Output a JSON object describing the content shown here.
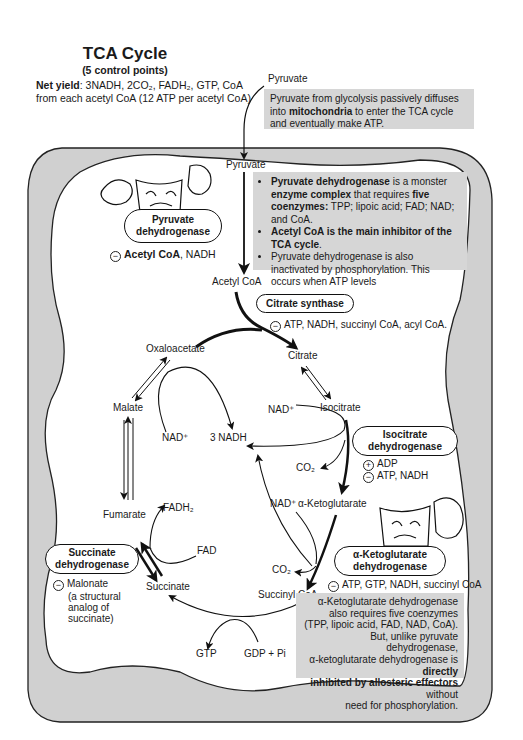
{
  "header": {
    "title": "TCA Cycle",
    "subtitle": "(5 control points)",
    "net_yield_label": "Net yield",
    "net_yield_line1": ":  3NADH, 2CO₂, FADH₂, GTP, CoA",
    "net_yield_line2": "from each acetyl CoA  (12 ATP per acetyl CoA)"
  },
  "entry": {
    "pyruvate_outside": "Pyruvate",
    "note": {
      "text_before": "Pyruvate from glycolysis passively diffuses into ",
      "bold": "mitochondria",
      "text_after": " to enter the TCA cycle and eventually make ATP."
    }
  },
  "pdh": {
    "pyruvate_inside": "Pyruvate",
    "enzyme_line1": "Pyruvate",
    "enzyme_line2": "dehydrogenase",
    "inhibitor_bold": "Acetyl CoA",
    "inhibitor_rest": ", NADH",
    "product": "Acetyl CoA",
    "note": {
      "bullet1_bold1": "Pyruvate dehydrogenase",
      "bullet1_text1": " is a monster ",
      "bullet1_bold2": "enzyme complex",
      "bullet1_text2": " that requires ",
      "bullet1_bold3": "five coenzymes:",
      "bullet1_text3": " TPP; lipoic acid; FAD; NAD; and CoA.",
      "bullet2_bold": "Acetyl CoA is the main inhibitor of the TCA cycle",
      "bullet2_text": ".",
      "bullet3": "Pyruvate dehydrogenase is also inactivated by phosphorylation.  This occurs when ATP levels"
    }
  },
  "citrate_synthase": {
    "enzyme": "Citrate synthase",
    "inhibitors": "ATP, NADH, succinyl CoA, acyl CoA."
  },
  "metabolites": {
    "oxaloacetate": "Oxaloacetate",
    "citrate": "Citrate",
    "isocitrate": "Isocitrate",
    "alpha_kg": "α-Ketoglutarate",
    "succinyl_coa": "Succinyl CoA",
    "succinate": "Succinate",
    "fumarate": "Fumarate",
    "malate": "Malate"
  },
  "cofactors": {
    "nad_malate": "NAD⁺",
    "three_nadh": "3 NADH",
    "nad_isocitrate": "NAD⁺",
    "co2_isocitrate": "CO₂",
    "nad_akg": "NAD⁺",
    "co2_akg": "CO₂",
    "fadh2": "FADH₂",
    "fad": "FAD",
    "gtp": "GTP",
    "gdp_pi": "GDP + Pi"
  },
  "isocitrate_dh": {
    "enzyme_line1": "Isocitrate",
    "enzyme_line2": "dehydrogenase",
    "activator": "ADP",
    "inhibitors": "ATP, NADH"
  },
  "akg_dh": {
    "enzyme_line1": "α-Ketoglutarate",
    "enzyme_line2": "dehydrogenase",
    "inhibitors": "ATP, GTP, NADH, succinyl CoA",
    "note": {
      "line1": "α-Ketoglutarate dehydrogenase",
      "line2": "also requires five coenzymes",
      "line3": "(TPP, lipoic acid, FAD, NAD, CoA).",
      "line4": "But, unlike pyruvate dehydrogenase,",
      "line5_text": "α-ketoglutarate dehydrogenase is ",
      "line5_bold": "directly",
      "line6_bold": "inhibited by allosteric effectors",
      "line6_text": " without",
      "line7": "need for phosphorylation."
    }
  },
  "succinate_dh": {
    "enzyme_line1": "Succinate",
    "enzyme_line2": "dehydrogenase",
    "inhibitor": "Malonate",
    "inhibitor_note1": "(a structural",
    "inhibitor_note2": "analog of",
    "inhibitor_note3": "succinate)"
  },
  "colors": {
    "membrane_fill": "#d0d0d0",
    "note_fill": "#d6d6d6",
    "line": "#111111",
    "background": "#ffffff"
  }
}
